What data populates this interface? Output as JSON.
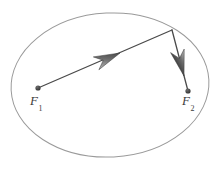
{
  "figure": {
    "background_color": "#ffffff",
    "width": 224,
    "height": 170,
    "ellipse": {
      "name": "ellipse-outline",
      "cx": 110,
      "cy": 85,
      "rx": 99,
      "ry": 72,
      "rotation_deg": -3,
      "stroke_color": "#9a9a9a",
      "stroke_width": 1,
      "fill": "none"
    },
    "foci": [
      {
        "id": "f1",
        "label": "F",
        "subscript": "1",
        "dot_x": 38,
        "dot_y": 88,
        "dot_r": 2.6,
        "dot_color": "#4a4a4a",
        "label_x": 30,
        "label_y": 94
      },
      {
        "id": "f2",
        "label": "F",
        "subscript": "2",
        "dot_x": 188,
        "dot_y": 91,
        "dot_r": 2.6,
        "dot_color": "#4a4a4a",
        "label_x": 182,
        "label_y": 94
      }
    ],
    "reflection_point": {
      "name": "tangent-contact-point",
      "x": 172,
      "y": 30
    },
    "segments": [
      {
        "id": "incoming-ray",
        "from": "f1",
        "to": "reflection_point",
        "x1": 38,
        "y1": 88,
        "x2": 172,
        "y2": 30,
        "stroke_color": "#4a4a4a",
        "stroke_width": 1.3
      },
      {
        "id": "outgoing-ray",
        "from": "reflection_point",
        "to": "f2",
        "x1": 172,
        "y1": 30,
        "x2": 188,
        "y2": 91,
        "stroke_color": "#4a4a4a",
        "stroke_width": 1.3
      }
    ],
    "arrows": [
      {
        "id": "arrow-incoming",
        "direction": "up-right",
        "tip_x": 120,
        "tip_y": 53,
        "angle_deg": -23.4,
        "length": 26,
        "half_width": 7,
        "color": "#3d3d3d"
      },
      {
        "id": "arrow-outgoing",
        "direction": "down",
        "tip_x": 184,
        "tip_y": 76,
        "angle_deg": 75.3,
        "length": 26,
        "half_width": 7,
        "color": "#3d3d3d"
      }
    ],
    "colors": {
      "ellipse_stroke": "#9a9a9a",
      "ray_stroke": "#4a4a4a",
      "arrow_fill": "#3d3d3d",
      "label_text": "#3c3c3c",
      "focus_dot": "#4a4a4a"
    }
  }
}
